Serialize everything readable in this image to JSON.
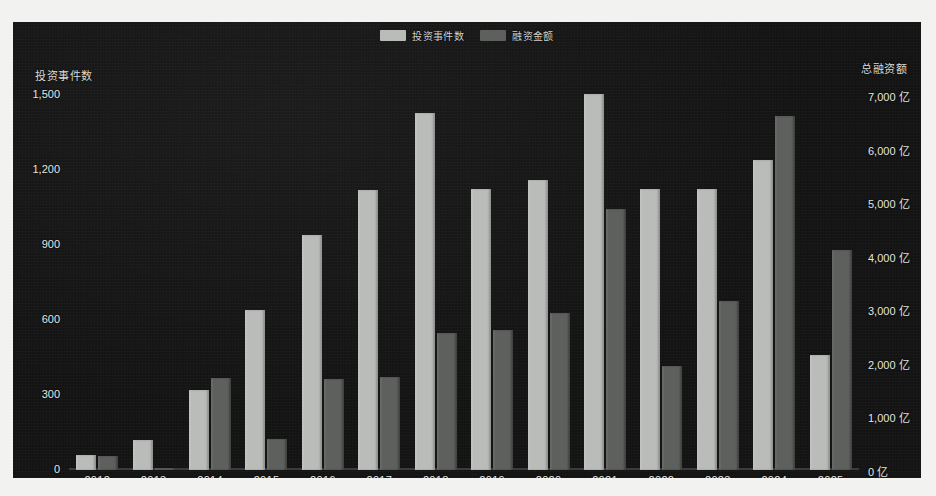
{
  "legend": [
    {
      "label": "投资事件数",
      "color": "#b9bcb8",
      "name": "legend-investment-events"
    },
    {
      "label": "融资金额",
      "color": "#5d605c",
      "name": "legend-financing-amount"
    }
  ],
  "axis": {
    "left_title": "投资事件数",
    "right_title": "总融资额",
    "left_ticks": [
      "1,500",
      "1,200",
      "900",
      "600",
      "300",
      "0"
    ],
    "right_ticks": [
      "7,000 亿",
      "6,000 亿",
      "5,000 亿",
      "4,000 亿",
      "3,000 亿",
      "2,000 亿",
      "1,000 亿",
      "0 亿"
    ]
  },
  "chart_data": {
    "type": "bar",
    "title": "",
    "xlabel": "",
    "ylabel": "投资事件数",
    "y2label": "总融资额",
    "categories": [
      "2012",
      "2013",
      "2014",
      "2015",
      "2016",
      "2017",
      "2018",
      "2019",
      "2020",
      "2021",
      "2022",
      "2023",
      "2024",
      "2025"
    ],
    "series": [
      {
        "name": "投资事件数",
        "color": "#b9bcb8",
        "axis": "left",
        "unit": "",
        "ylim": [
          0,
          1500
        ],
        "values": [
          60,
          120,
          320,
          640,
          940,
          1120,
          1430,
          1125,
          1160,
          1505,
          1125,
          1125,
          1240,
          460
        ]
      },
      {
        "name": "融资金额",
        "color": "#5d605c",
        "axis": "right",
        "unit": "亿",
        "ylim": [
          0,
          7000
        ],
        "values": [
          260,
          30,
          1720,
          570,
          1690,
          1740,
          2550,
          2610,
          2930,
          4880,
          1950,
          3150,
          6600,
          4100
        ]
      }
    ],
    "grid": false,
    "legend_position": "top-center"
  }
}
